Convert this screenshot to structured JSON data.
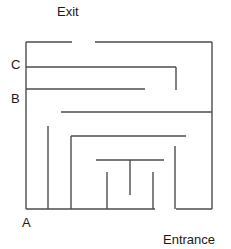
{
  "figure": {
    "kind": "maze-diagram",
    "stroke_color": "#4d4d4d",
    "background_color": "#ffffff",
    "text_color": "#1a1a1a",
    "width": 231,
    "height": 249
  },
  "labels": {
    "exit": "Exit",
    "entrance": "Entrance",
    "point_a": "A",
    "point_b": "B",
    "point_c": "C"
  },
  "maze": {
    "bounds": {
      "left": 26,
      "top": 42,
      "right": 212,
      "bottom": 209
    },
    "openings": [
      {
        "name": "exit-gap",
        "side": "top",
        "from": 72,
        "to": 95
      },
      {
        "name": "entrance-gap",
        "side": "bottom",
        "from": 155,
        "to": 176
      }
    ],
    "walls": [
      {
        "name": "outer-top-left-segment",
        "x1": 26,
        "y1": 42,
        "x2": 72,
        "y2": 42
      },
      {
        "name": "outer-top-right-segment",
        "x1": 95,
        "y1": 42,
        "x2": 212,
        "y2": 42
      },
      {
        "name": "outer-left",
        "x1": 26,
        "y1": 42,
        "x2": 26,
        "y2": 209
      },
      {
        "name": "outer-right",
        "x1": 212,
        "y1": 42,
        "x2": 212,
        "y2": 209
      },
      {
        "name": "outer-bottom-left-segment",
        "x1": 26,
        "y1": 209,
        "x2": 155,
        "y2": 209
      },
      {
        "name": "outer-bottom-right-segment",
        "x1": 176,
        "y1": 209,
        "x2": 212,
        "y2": 209
      },
      {
        "name": "wall-c-horizontal",
        "x1": 26,
        "y1": 67,
        "x2": 176,
        "y2": 67
      },
      {
        "name": "wall-c-vertical-drop",
        "x1": 176,
        "y1": 67,
        "x2": 176,
        "y2": 90
      },
      {
        "name": "wall-b-horizontal",
        "x1": 26,
        "y1": 89,
        "x2": 145,
        "y2": 89
      },
      {
        "name": "wall-mid-horizontal",
        "x1": 61,
        "y1": 112,
        "x2": 212,
        "y2": 112
      },
      {
        "name": "wall-left-stub-vertical",
        "x1": 48,
        "y1": 126,
        "x2": 48,
        "y2": 209
      },
      {
        "name": "wall-inner-left-vertical",
        "x1": 71,
        "y1": 136,
        "x2": 71,
        "y2": 209
      },
      {
        "name": "wall-inner-top-horizontal",
        "x1": 71,
        "y1": 136,
        "x2": 186,
        "y2": 136
      },
      {
        "name": "wall-inner-right-vertical",
        "x1": 175,
        "y1": 146,
        "x2": 175,
        "y2": 209
      },
      {
        "name": "wall-core-horizontal",
        "x1": 96,
        "y1": 160,
        "x2": 164,
        "y2": 160
      },
      {
        "name": "wall-core-left-tooth",
        "x1": 107,
        "y1": 172,
        "x2": 107,
        "y2": 209
      },
      {
        "name": "wall-core-center-tooth",
        "x1": 130,
        "y1": 160,
        "x2": 130,
        "y2": 195
      },
      {
        "name": "wall-core-right-tooth",
        "x1": 153,
        "y1": 172,
        "x2": 153,
        "y2": 209
      }
    ]
  }
}
